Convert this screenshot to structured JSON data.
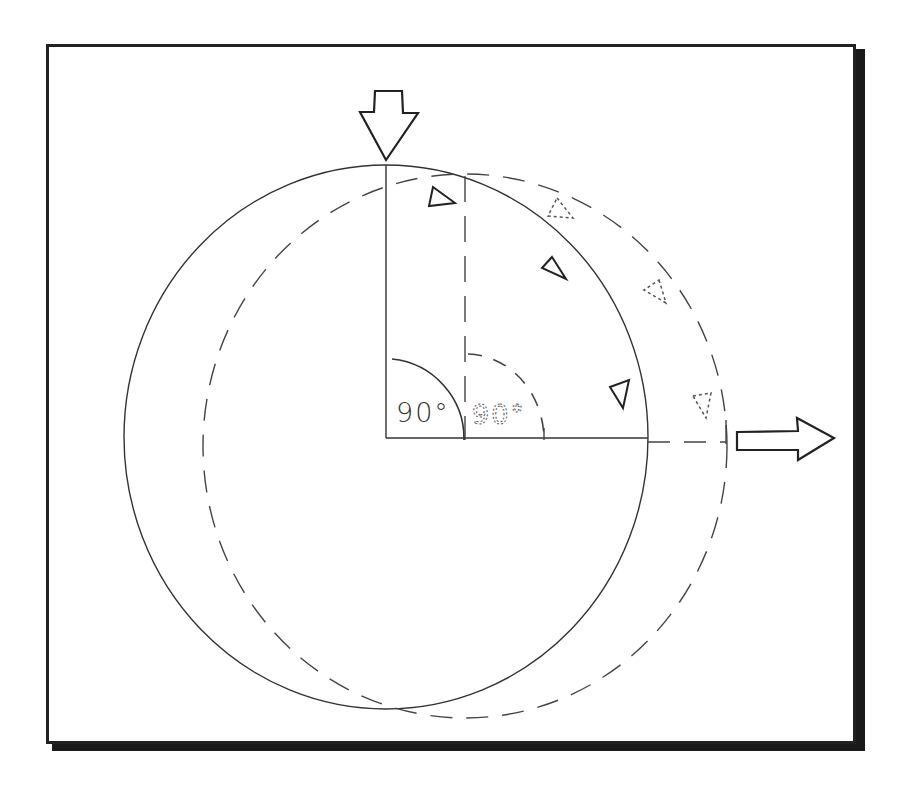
{
  "diagram": {
    "type": "rotation-precession-illustration",
    "frame": {
      "border_color": "#222222",
      "shadow_color": "#1a1a1a"
    },
    "labels": {
      "angle_solid": "90°",
      "angle_dashed": "90°"
    },
    "elements": {
      "solid_circle": {
        "style": "solid",
        "cx": 386,
        "cy": 437,
        "rx": 262,
        "ry": 272
      },
      "dashed_circle": {
        "style": "dashed",
        "cx": 465,
        "cy": 446,
        "rx": 262,
        "ry": 272
      },
      "input_arrow": {
        "direction": "down",
        "style": "outline",
        "tip": [
          386,
          160
        ]
      },
      "output_arrow": {
        "direction": "right",
        "style": "outline",
        "tail": [
          737,
          438
        ]
      },
      "solid_direction_markers": 3,
      "dashed_direction_markers": 3
    },
    "colors": {
      "line": "#333333",
      "dashed_line": "#555555",
      "background": "#ffffff"
    }
  }
}
